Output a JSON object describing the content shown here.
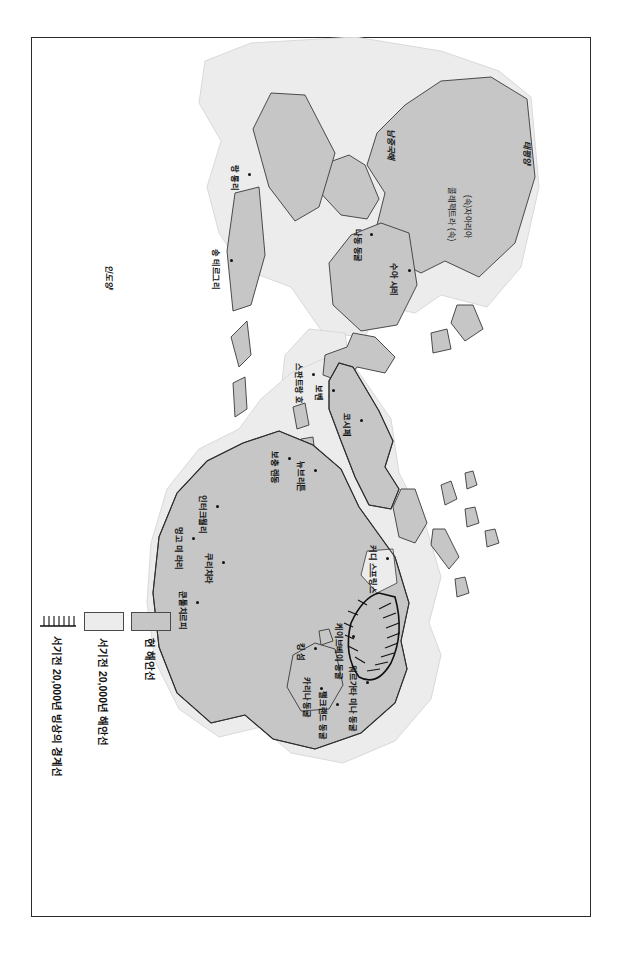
{
  "figure": {
    "orientation_note": "rotated-90-clockwise",
    "oceans": [
      {
        "name": "태평양",
        "x": 104,
        "y": 60
      },
      {
        "name": "남중국해",
        "x": 92,
        "y": 196
      },
      {
        "name": "인도양",
        "x": 228,
        "y": 478
      }
    ],
    "regions": [
      {
        "name": "(속)자아리아",
        "x": 158,
        "y": 120
      },
      {
        "name": "콜레펙트라 (속)",
        "x": 150,
        "y": 136
      }
    ],
    "sites": [
      {
        "name": "수아 시레",
        "x": 232,
        "y": 180,
        "dx": -6,
        "dy": 14
      },
      {
        "name": "나동 동굴",
        "x": 196,
        "y": 218,
        "dx": -4,
        "dy": 12
      },
      {
        "name": "랑 롱리",
        "x": 136,
        "y": 340,
        "dx": -8,
        "dy": 13
      },
      {
        "name": "송 테르그리",
        "x": 222,
        "y": 358,
        "dx": -10,
        "dy": 14
      },
      {
        "name": "코시페",
        "x": 382,
        "y": 228,
        "dx": -6,
        "dy": 13
      },
      {
        "name": "보벤",
        "x": 352,
        "y": 256,
        "dx": -4,
        "dy": 13
      },
      {
        "name": "스판트랑 호",
        "x": 336,
        "y": 276,
        "dx": -10,
        "dy": 13
      },
      {
        "name": "뉴브리튼",
        "x": 432,
        "y": 274,
        "dx": -8,
        "dy": 13
      },
      {
        "name": "보충 렌동",
        "x": 420,
        "y": 300,
        "dx": -6,
        "dy": 13
      },
      {
        "name": "커디 스프링스",
        "x": 520,
        "y": 202,
        "dx": -12,
        "dy": 13
      },
      {
        "name": "인터크월리",
        "x": 468,
        "y": 372,
        "dx": -10,
        "dy": 13
      },
      {
        "name": "멍고 미 라리",
        "x": 500,
        "y": 396,
        "dx": -10,
        "dy": 13
      },
      {
        "name": "쿠리치라",
        "x": 524,
        "y": 366,
        "dx": -8,
        "dy": 13
      },
      {
        "name": "쿤툴치르피",
        "x": 564,
        "y": 392,
        "dx": -10,
        "dy": 13
      },
      {
        "name": "킹 섬",
        "x": 610,
        "y": 274,
        "dx": -4,
        "dy": 13
      },
      {
        "name": "케이브베이 동굴",
        "x": 598,
        "y": 236,
        "dx": -12,
        "dy": 13
      },
      {
        "name": "워르가타 미나 동굴",
        "x": 644,
        "y": 222,
        "dx": -16,
        "dy": 13
      },
      {
        "name": "카리나 동굴",
        "x": 650,
        "y": 268,
        "dx": -10,
        "dy": 13
      },
      {
        "name": "팰크랜드 동굴",
        "x": 666,
        "y": 252,
        "dx": -12,
        "dy": 13
      }
    ]
  },
  "legend": {
    "items": [
      {
        "key": "present-coastline",
        "label": "현 해안선",
        "swatch": "now"
      },
      {
        "key": "lgm-coastline",
        "label": "서기전 20,000년 해안선",
        "swatch": "old"
      },
      {
        "key": "lgm-ice-boundary",
        "label": "서기전 20,000년 빙상의 경계선",
        "swatch": "ice"
      }
    ]
  },
  "colors": {
    "land_present": "#c6c6c6",
    "land_lgm": "#ececec",
    "coastline": "#3a3a3a",
    "text": "#111111"
  }
}
